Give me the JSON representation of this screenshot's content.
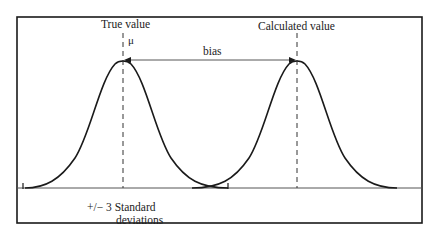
{
  "diagram": {
    "title": "",
    "labels": {
      "true_value": "True value",
      "mu": "μ",
      "calculated_value": "Calculated value",
      "bias": "bias",
      "std_dev_line1": "+/− 3 Standard",
      "std_dev_line2": "deviations"
    },
    "curves": [
      {
        "name": "true-distribution",
        "center_x": 123,
        "peak_y": 60,
        "baseline_y": 188,
        "left_end_x": 23,
        "right_end_x": 228
      },
      {
        "name": "calculated-distribution",
        "center_x": 297,
        "peak_y": 60,
        "baseline_y": 188,
        "left_end_x": 197,
        "right_end_x": 397
      }
    ],
    "bias_arrow": {
      "from_x": 125,
      "to_x": 295,
      "y": 60,
      "heads": "both"
    },
    "frame": {
      "left": 17,
      "top": 17,
      "right": 422,
      "bottom": 223
    },
    "colors": {
      "stroke": "#1a1a1a",
      "baseline": "#555555",
      "background": "#ffffff"
    }
  }
}
